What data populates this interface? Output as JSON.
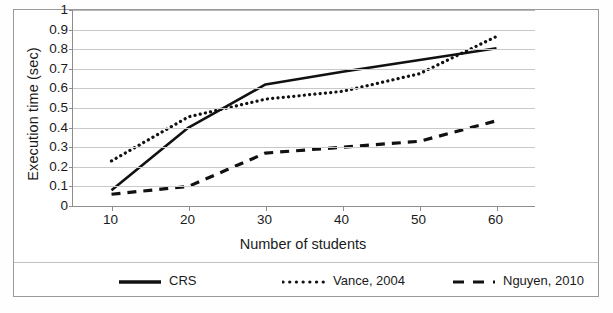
{
  "chart_data": {
    "type": "line",
    "title": "",
    "xlabel": "Number of students",
    "ylabel": "Execution time (sec)",
    "xlim": [
      5,
      65
    ],
    "ylim": [
      0,
      1
    ],
    "x_ticks": [
      "10",
      "20",
      "30",
      "40",
      "50",
      "60"
    ],
    "x_tick_values": [
      10,
      20,
      30,
      40,
      50,
      60
    ],
    "y_ticks": [
      "1",
      "0.9",
      "0.8",
      "0.7",
      "0.6",
      "0.5",
      "0.4",
      "0.3",
      "0.2",
      "0.1",
      "0"
    ],
    "y_tick_values": [
      1,
      0.9,
      0.8,
      0.7,
      0.6,
      0.5,
      0.4,
      0.3,
      0.2,
      0.1,
      0
    ],
    "grid": "horizontal",
    "legend_position": "bottom",
    "series": [
      {
        "name": "CRS",
        "style": "solid",
        "color": "#111111",
        "x": [
          10,
          20,
          30,
          40,
          50,
          60
        ],
        "values": [
          0.08,
          0.4,
          0.62,
          0.685,
          0.745,
          0.805
        ]
      },
      {
        "name": "Vance, 2004",
        "style": "dotted",
        "color": "#111111",
        "x": [
          10,
          20,
          30,
          40,
          50,
          60
        ],
        "values": [
          0.23,
          0.455,
          0.545,
          0.585,
          0.675,
          0.865
        ]
      },
      {
        "name": "Nguyen, 2010",
        "style": "dashed",
        "color": "#111111",
        "x": [
          10,
          20,
          30,
          40,
          50,
          60
        ],
        "values": [
          0.06,
          0.1,
          0.27,
          0.3,
          0.33,
          0.435
        ]
      }
    ]
  },
  "legend": {
    "items": [
      {
        "label": "CRS",
        "style": "solid"
      },
      {
        "label": "Vance, 2004",
        "style": "dotted"
      },
      {
        "label": "Nguyen, 2010",
        "style": "dashed"
      }
    ]
  }
}
